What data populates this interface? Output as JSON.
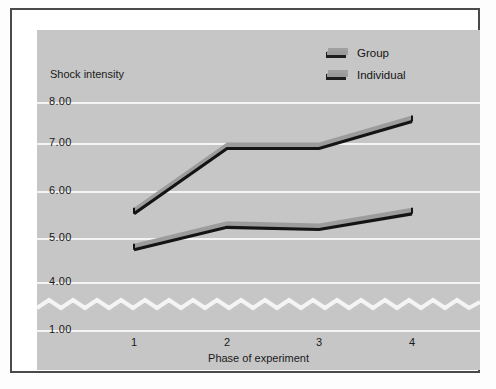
{
  "chart_data": {
    "type": "line",
    "title": "",
    "xlabel": "Phase of experiment",
    "ylabel": "Shock intensity",
    "categories": [
      "1",
      "2",
      "3",
      "4"
    ],
    "x": [
      1,
      2,
      3,
      4
    ],
    "ytick_labels": [
      "8.00",
      "7.00",
      "6.00",
      "5.00",
      "4.00",
      "1.00"
    ],
    "yticks": [
      8.0,
      7.0,
      6.0,
      5.0,
      4.0,
      1.0
    ],
    "ylim": [
      1.0,
      8.0
    ],
    "axis_break": true,
    "axis_break_between": [
      1.0,
      4.0
    ],
    "grid": true,
    "grid_color": "#f4f4f4",
    "legend_position": "top-right",
    "series": [
      {
        "name": "Group",
        "values": [
          5.65,
          7.1,
          7.1,
          7.7
        ]
      },
      {
        "name": "Individual",
        "values": [
          4.85,
          5.35,
          5.3,
          5.65
        ]
      }
    ]
  },
  "axes": {
    "y_title": "Shock intensity",
    "x_title": "Phase of experiment",
    "y_tick_labels": [
      "8.00",
      "7.00",
      "6.00",
      "5.00",
      "4.00",
      "1.00"
    ],
    "x_tick_labels": [
      "1",
      "2",
      "3",
      "4"
    ]
  },
  "legend": {
    "items": [
      {
        "label": "Group",
        "swatch": "ribbon-swatch-icon"
      },
      {
        "label": "Individual",
        "swatch": "ribbon-swatch-icon"
      }
    ]
  },
  "colors": {
    "plot_background": "#c6c6c6",
    "gridline": "#f4f4f4",
    "line_top_face": "#9c9c9c",
    "line_edge": "#141414",
    "frame": "#4a4a4a",
    "text": "#1a1a1a",
    "page_background": "#ffffff"
  }
}
